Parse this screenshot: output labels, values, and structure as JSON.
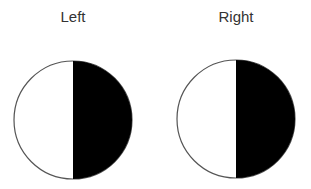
{
  "colors": {
    "background": "#ffffff",
    "outline": "#555555",
    "dark_half": "#000000",
    "light_half": "#ffffff",
    "label": "#333333"
  },
  "figures": [
    {
      "label": "Left",
      "center": [
        73,
        120
      ],
      "radius": 59,
      "dark_side": "right",
      "label_x": 73
    },
    {
      "label": "Right",
      "center": [
        236,
        119
      ],
      "radius": 59,
      "dark_side": "right",
      "label_x": 236
    }
  ]
}
